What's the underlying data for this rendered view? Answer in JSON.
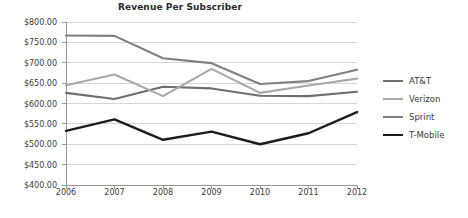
{
  "chart_data": {
    "type": "line",
    "title": "Revenue Per Subscriber",
    "xlabel": "",
    "ylabel": "",
    "categories": [
      "2006",
      "2007",
      "2008",
      "2009",
      "2010",
      "2011",
      "2012"
    ],
    "ylim": [
      400,
      800
    ],
    "ytick_step": 50,
    "ytick_labels": [
      "$800.00",
      "$750.00",
      "$700.00",
      "$650.00",
      "$600.00",
      "$550.00",
      "$500.00",
      "$450.00",
      "$400.00"
    ],
    "ytick_values": [
      800,
      750,
      700,
      650,
      600,
      550,
      500,
      450,
      400
    ],
    "grid": true,
    "grid_axis": "y",
    "legend_position": "right",
    "series": [
      {
        "name": "AT&T",
        "color": "#6e6e6e",
        "width": 2.1,
        "values": [
          626,
          611,
          641,
          637,
          619,
          618,
          629
        ]
      },
      {
        "name": "Verizon",
        "color": "#a8a8a8",
        "width": 2.1,
        "values": [
          645,
          671,
          618,
          685,
          626,
          644,
          661
        ]
      },
      {
        "name": "Sprint",
        "color": "#808080",
        "width": 2.1,
        "values": [
          767,
          766,
          711,
          699,
          648,
          655,
          683
        ]
      },
      {
        "name": "T-Mobile",
        "color": "#1c1c1c",
        "width": 2.4,
        "values": [
          533,
          561,
          511,
          531,
          500,
          527,
          579
        ]
      }
    ]
  },
  "axes": {
    "axis_color": "#9a9a9a",
    "grid_color": "#d6d6d6",
    "text_color": "#3b3b3b"
  }
}
